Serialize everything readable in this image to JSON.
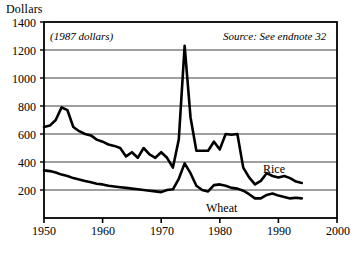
{
  "chart_data": {
    "type": "line",
    "title": "",
    "ylabel": "Dollars",
    "xlabel": "",
    "annotation_units": "(1987 dollars)",
    "annotation_source": "Source: See endnote 32",
    "grid": true,
    "legend_position": "inline-labels",
    "xlim": [
      1950,
      2000
    ],
    "ylim": [
      0,
      1400
    ],
    "ytick_labels": [
      "1400",
      "1200",
      "1000",
      "800",
      "600",
      "400",
      "200"
    ],
    "ytick_values": [
      1400,
      1200,
      1000,
      800,
      600,
      400,
      200
    ],
    "xtick_labels": [
      "1950",
      "1960",
      "1970",
      "1980",
      "1990",
      "2000"
    ],
    "xtick_values": [
      1950,
      1960,
      1970,
      1980,
      1990,
      2000
    ],
    "x": [
      1950,
      1951,
      1952,
      1953,
      1954,
      1955,
      1956,
      1957,
      1958,
      1959,
      1960,
      1961,
      1962,
      1963,
      1964,
      1965,
      1966,
      1967,
      1968,
      1969,
      1970,
      1971,
      1972,
      1973,
      1974,
      1975,
      1976,
      1977,
      1978,
      1979,
      1980,
      1981,
      1982,
      1983,
      1984,
      1985,
      1986,
      1987,
      1988,
      1989,
      1990,
      1991,
      1992,
      1993,
      1994
    ],
    "series": [
      {
        "name": "Rice",
        "values": [
          650,
          660,
          700,
          790,
          770,
          650,
          620,
          600,
          590,
          560,
          545,
          525,
          515,
          500,
          440,
          470,
          430,
          500,
          455,
          430,
          470,
          430,
          360,
          560,
          1230,
          720,
          480,
          480,
          480,
          545,
          490,
          600,
          595,
          600,
          360,
          290,
          240,
          265,
          320,
          300,
          290,
          300,
          285,
          260,
          250
        ]
      },
      {
        "name": "Wheat",
        "values": [
          340,
          335,
          325,
          310,
          300,
          285,
          275,
          265,
          255,
          245,
          240,
          230,
          225,
          220,
          215,
          210,
          205,
          200,
          195,
          190,
          185,
          200,
          205,
          280,
          390,
          320,
          230,
          200,
          190,
          235,
          240,
          230,
          215,
          210,
          195,
          170,
          140,
          140,
          165,
          175,
          160,
          150,
          140,
          145,
          140
        ]
      }
    ],
    "series_label_rice": "Rice",
    "series_label_wheat": "Wheat"
  }
}
